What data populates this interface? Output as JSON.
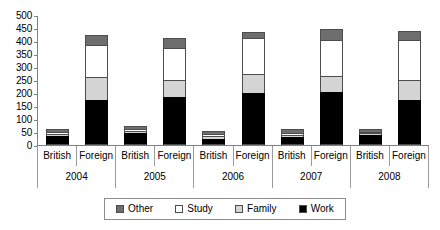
{
  "chart_data": {
    "type": "bar",
    "title": "",
    "xlabel": "",
    "ylabel": "",
    "ylim": [
      0,
      500
    ],
    "ytick_step": 50,
    "yticks": [
      "500",
      "450",
      "400",
      "350",
      "300",
      "250",
      "200",
      "150",
      "100",
      "50",
      "0"
    ],
    "grid": false,
    "stacked": true,
    "legend_position": "bottom",
    "legend": [
      "Other",
      "Study",
      "Family",
      "Work"
    ],
    "series_colors": {
      "Other": "#6e6e6e",
      "Study": "#ffffff",
      "Family": "#d4d4d4",
      "Work": "#000000"
    },
    "years": [
      "2004",
      "2005",
      "2006",
      "2007",
      "2008"
    ],
    "categories": [
      "British",
      "Foreign"
    ],
    "groups": [
      {
        "year": "2004",
        "bars": [
          {
            "category": "British",
            "total": 60,
            "work": 35,
            "family": 8,
            "study": 7,
            "other": 10
          },
          {
            "category": "Foreign",
            "total": 425,
            "work": 175,
            "family": 85,
            "study": 125,
            "other": 40
          }
        ]
      },
      {
        "year": "2005",
        "bars": [
          {
            "category": "British",
            "total": 75,
            "work": 45,
            "family": 10,
            "study": 8,
            "other": 12
          },
          {
            "category": "Foreign",
            "total": 410,
            "work": 185,
            "family": 65,
            "study": 125,
            "other": 35
          }
        ]
      },
      {
        "year": "2006",
        "bars": [
          {
            "category": "British",
            "total": 55,
            "work": 25,
            "family": 10,
            "study": 8,
            "other": 12
          },
          {
            "category": "Foreign",
            "total": 435,
            "work": 200,
            "family": 75,
            "study": 135,
            "other": 25
          }
        ]
      },
      {
        "year": "2007",
        "bars": [
          {
            "category": "British",
            "total": 60,
            "work": 30,
            "family": 10,
            "study": 8,
            "other": 12
          },
          {
            "category": "Foreign",
            "total": 445,
            "work": 205,
            "family": 60,
            "study": 140,
            "other": 40
          }
        ]
      },
      {
        "year": "2008",
        "bars": [
          {
            "category": "British",
            "total": 62,
            "work": 38,
            "family": 8,
            "study": 6,
            "other": 10
          },
          {
            "category": "Foreign",
            "total": 440,
            "work": 175,
            "family": 75,
            "study": 155,
            "other": 35
          }
        ]
      }
    ]
  }
}
